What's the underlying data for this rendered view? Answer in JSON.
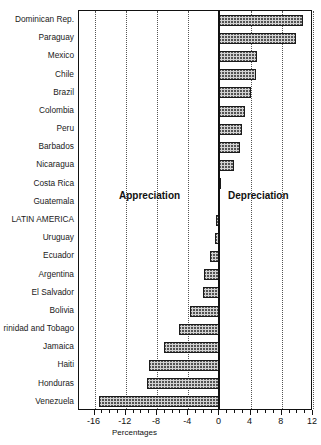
{
  "chart_data": {
    "type": "bar",
    "orientation": "horizontal",
    "title": "",
    "subtitle": "",
    "xlabel": "Percentages",
    "ylabel": "",
    "xlim": [
      -18,
      12
    ],
    "xticks": [
      -16,
      -12,
      -8,
      -4,
      0,
      4,
      8,
      12
    ],
    "xtick_labels": [
      "-16",
      "-12",
      "-8",
      "-4",
      "0",
      "4",
      "8",
      "12"
    ],
    "grid": "vertical dotted gridlines at major ticks",
    "legend": "none",
    "zero_reference_line": 0,
    "categories": [
      "Dominican Rep.",
      "Paraguay",
      "Mexico",
      "Chile",
      "Brazil",
      "Colombia",
      "Peru",
      "Barbados",
      "Nicaragua",
      "Costa Rica",
      "Guatemala",
      "LATIN AMERICA",
      "Uruguay",
      "Ecuador",
      "Argentina",
      "El Salvador",
      "Bolivia",
      "rinidad and Tobago",
      "Jamaica",
      "Haiti",
      "Honduras",
      "Venezuela"
    ],
    "values": [
      10.7,
      9.8,
      4.8,
      4.7,
      4.1,
      3.3,
      2.9,
      2.6,
      1.9,
      0.2,
      -0.2,
      -0.4,
      -0.6,
      -1.2,
      -2.0,
      -2.1,
      -3.8,
      -5.2,
      -7.1,
      -9.0,
      -9.3,
      -15.5
    ],
    "annotations": [
      {
        "text": "Appreciation",
        "side": "left"
      },
      {
        "text": "Depreciation",
        "side": "right"
      }
    ]
  },
  "axis": {
    "x_title": "Percentages"
  },
  "annotations": {
    "appreciation": "Appreciation",
    "depreciation": "Depreciation"
  },
  "colors": {
    "bar_fill": "#d2d2d2",
    "bar_edge": "#1b1b1b",
    "axis": "#111111",
    "grid": "#555555",
    "background": "#ffffff"
  }
}
